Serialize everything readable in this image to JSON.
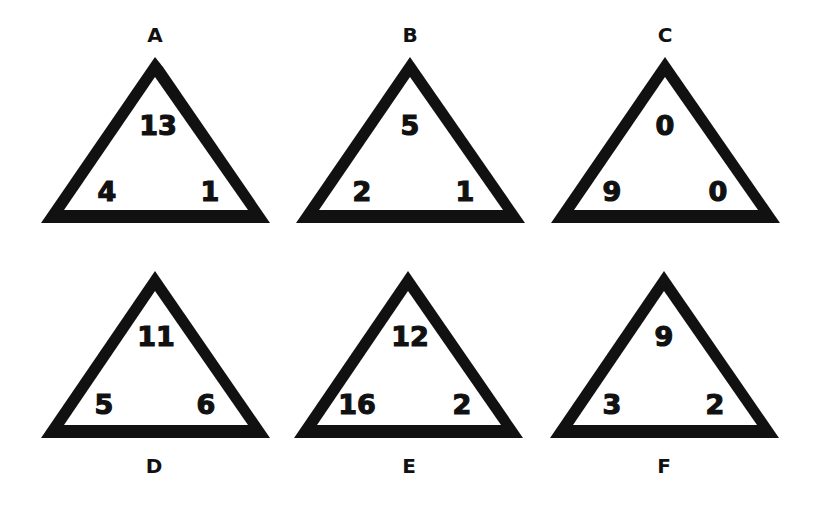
{
  "puzzle": {
    "type": "number-triangle-puzzle",
    "colors": {
      "background": "#ffffff",
      "stroke": "#111111",
      "text": "#111111"
    },
    "triangles": [
      {
        "label": "A",
        "top": "13",
        "left": "4",
        "right": "1"
      },
      {
        "label": "B",
        "top": "5",
        "left": "2",
        "right": "1"
      },
      {
        "label": "C",
        "top": "0",
        "left": "9",
        "right": "0"
      },
      {
        "label": "D",
        "top": "11",
        "left": "5",
        "right": "6"
      },
      {
        "label": "E",
        "top": "12",
        "left": "16",
        "right": "2"
      },
      {
        "label": "F",
        "top": "9",
        "left": "3",
        "right": "2"
      }
    ]
  }
}
